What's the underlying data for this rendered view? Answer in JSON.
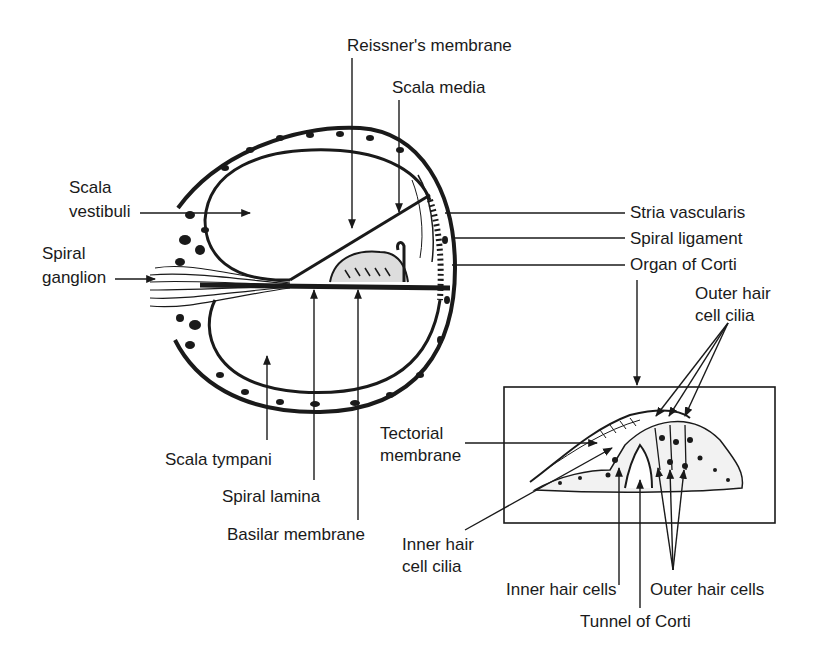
{
  "diagram": {
    "cochlea_labels": {
      "reissners_membrane": "Reissner's membrane",
      "scala_media": "Scala media",
      "scala_vestibuli_line1": "Scala",
      "scala_vestibuli_line2": "vestibuli",
      "spiral_ganglion_line1": "Spiral",
      "spiral_ganglion_line2": "ganglion",
      "stria_vascularis": "Stria vascularis",
      "spiral_ligament": "Spiral ligament",
      "organ_of_corti": "Organ of Corti",
      "scala_tympani": "Scala tympani",
      "spiral_lamina": "Spiral lamina",
      "basilar_membrane": "Basilar membrane"
    },
    "corti_labels": {
      "outer_hair_cell_cilia_line1": "Outer hair",
      "outer_hair_cell_cilia_line2": "cell cilia",
      "tectorial_membrane_line1": "Tectorial",
      "tectorial_membrane_line2": "membrane",
      "inner_hair_cell_cilia_line1": "Inner hair",
      "inner_hair_cell_cilia_line2": "cell cilia",
      "inner_hair_cells": "Inner hair cells",
      "outer_hair_cells": "Outer hair cells",
      "tunnel_of_corti": "Tunnel of Corti"
    },
    "colors": {
      "ink": "#1a1a1a",
      "background": "#ffffff"
    }
  }
}
